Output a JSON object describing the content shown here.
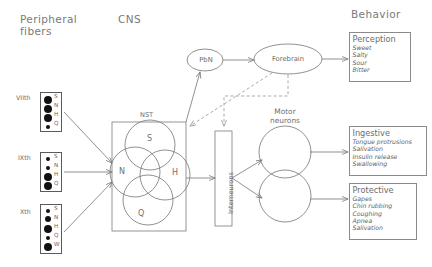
{
  "headers": {
    "peripheral": "Peripheral\nfibers",
    "peripheral_line1": "Peripheral",
    "peripheral_line2": "fibers",
    "cns": "CNS",
    "behavior": "Behavior"
  },
  "peripheral_fibers": [
    {
      "nerve": "VIIth",
      "rows": [
        {
          "letter": "S",
          "size": "large"
        },
        {
          "letter": "N",
          "size": "large"
        },
        {
          "letter": "H",
          "size": "large"
        },
        {
          "letter": "Q",
          "size": "small"
        }
      ]
    },
    {
      "nerve": "IXth",
      "rows": [
        {
          "letter": "S",
          "size": "small"
        },
        {
          "letter": "N",
          "size": "small"
        },
        {
          "letter": "H",
          "size": "large"
        },
        {
          "letter": "Q",
          "size": "large"
        }
      ]
    },
    {
      "nerve": "Xth",
      "rows": [
        {
          "letter": "S",
          "size": "small"
        },
        {
          "letter": "N",
          "size": "medium"
        },
        {
          "letter": "H",
          "size": "large"
        },
        {
          "letter": "Q",
          "size": "small"
        },
        {
          "letter": "W",
          "size": "large"
        }
      ]
    }
  ],
  "cns": {
    "nst_label": "NST",
    "nst_circles": [
      "S",
      "N",
      "H",
      "Q"
    ],
    "pbn_label": "PbN",
    "forebrain_label": "Forebrain",
    "interneurons_label": "Interneurons",
    "motor_label_line1": "Motor",
    "motor_label_line2": "neurons"
  },
  "behavior_boxes": [
    {
      "title": "Perception",
      "items": [
        "Sweet",
        "Salty",
        "Sour",
        "Bitter"
      ]
    },
    {
      "title": "Ingestive",
      "items": [
        "Tongue  protrusions",
        "Salivation",
        "Insulin  release",
        "Swallowing"
      ]
    },
    {
      "title": "Protective",
      "items": [
        "Gapes",
        "Chin  rubbing",
        "Coughing",
        "Apnea",
        "Salivation"
      ]
    }
  ],
  "colors": {
    "stroke": "#7d7d7d",
    "box_stroke": "#8a8a8a",
    "fiber_stroke": "#5a5a5a",
    "text": "#6a6a6a",
    "dot": "#111111",
    "background": "#ffffff"
  }
}
